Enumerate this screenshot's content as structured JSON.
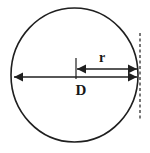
{
  "figure": {
    "background_color": "#ffffff",
    "stroke_color": "#1f1f1f",
    "text_color": "#171717",
    "width": 150,
    "height": 153
  },
  "shapes": {
    "circle": {
      "name": "circle-outline",
      "center_x": 74.5,
      "center_y": 75,
      "radius_x": 63.5,
      "radius_y": 67,
      "stroke_width": 1.6,
      "fill": "none"
    },
    "tangent_line": {
      "name": "dashed-tangent-line",
      "x": 140,
      "y_start": 33,
      "y_end": 121,
      "dash_pattern": "3,2.5",
      "stroke_width": 1.2
    },
    "center_tick": {
      "name": "center-tick-mark",
      "x": 76,
      "y_start": 58,
      "y_end": 79,
      "stroke_width": 1.2
    }
  },
  "measurements": [
    {
      "id": "radius",
      "label": "r",
      "label_x": 102,
      "label_y": 62,
      "label_font_size": 14,
      "arrow_y": 69,
      "arrow_x_start": 77,
      "arrow_x_end": 137,
      "arrowheads": "both",
      "stroke_width": 1.5
    },
    {
      "id": "diameter",
      "label": "D",
      "label_x": 81,
      "label_y": 95,
      "label_font_size": 15,
      "arrow_y": 77,
      "arrow_x_start": 14,
      "arrow_x_end": 137,
      "arrowheads": "both",
      "stroke_width": 1.5
    }
  ]
}
